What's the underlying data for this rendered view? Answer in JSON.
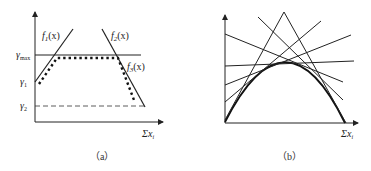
{
  "panels": [
    {
      "caption": "（a）",
      "x_axis_label": "Σx",
      "x_axis_sub": "i",
      "y_ticks": [
        {
          "label": "γ",
          "sub": "max"
        },
        {
          "label": "γ",
          "sub": "1"
        },
        {
          "label": "γ",
          "sub": "2"
        }
      ],
      "curves": [
        {
          "name": "f",
          "sub": "1",
          "arg": "(x)"
        },
        {
          "name": "f",
          "sub": "2",
          "arg": "(x)"
        },
        {
          "name": "f",
          "sub": "3",
          "arg": "(x)"
        }
      ]
    },
    {
      "caption": "（b）",
      "x_axis_label": "Σx",
      "x_axis_sub": "i"
    }
  ],
  "colors": {
    "line": "#222222",
    "background": "#ffffff"
  }
}
